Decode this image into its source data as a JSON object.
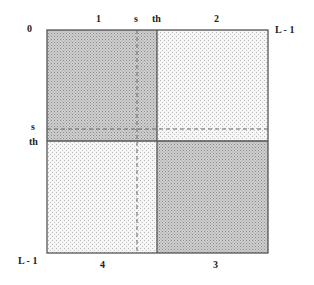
{
  "diagram": {
    "top_labels": {
      "origin": "0",
      "region1": "1",
      "s": "s",
      "th": "th",
      "region2": "2",
      "right": "L - 1"
    },
    "left_labels": {
      "s": "s",
      "th": "th",
      "bottom": "L - 1"
    },
    "bottom_labels": {
      "region4": "4",
      "region3": "3"
    },
    "regions": [
      {
        "id": "1",
        "position": "top-left",
        "shade": "dark"
      },
      {
        "id": "2",
        "position": "top-right",
        "shade": "light"
      },
      {
        "id": "3",
        "position": "bottom-right",
        "shade": "dark"
      },
      {
        "id": "4",
        "position": "bottom-left",
        "shade": "light"
      }
    ],
    "colors": {
      "dark_fill": "#c4c4c4",
      "light_fill": "#ececec",
      "stroke": "#555555",
      "dash": "#666666"
    }
  }
}
